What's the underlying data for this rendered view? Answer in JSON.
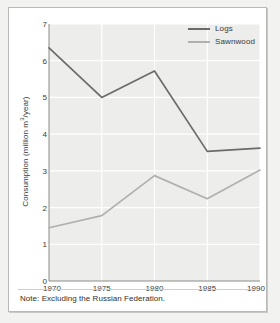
{
  "figure": {
    "footnote": "Note: Excluding the Russian Federation.",
    "frame_color": "#b9b9b5",
    "background": "#ffffff"
  },
  "legend": {
    "position": "top-right",
    "entries": [
      {
        "label": "Logs",
        "color": "#6b6b6b",
        "icon": "line-swatch-icon"
      },
      {
        "label": "Sawnwood",
        "color": "#b0b0b0",
        "icon": "line-swatch-icon"
      }
    ]
  },
  "axes": {
    "y_title_main": "Consumption (million m",
    "y_title_sup": "3",
    "y_title_tail": "/year)",
    "y_ticks": [
      "0",
      "1",
      "2",
      "3",
      "4",
      "5",
      "6",
      "7"
    ],
    "x_ticks": [
      "1970",
      "1975",
      "1980",
      "1985",
      "1990"
    ]
  },
  "style": {
    "plot_background": "#ededeb",
    "gridline_color": "#ffffff",
    "axis_text_color": "#3a3a3a"
  },
  "chart_data": {
    "type": "line",
    "title": "",
    "xlabel": "",
    "ylabel": "Consumption (million m3/year)",
    "x": [
      1970,
      1975,
      1980,
      1985,
      1990
    ],
    "categories": [
      "1970",
      "1975",
      "1980",
      "1985",
      "1990"
    ],
    "series": [
      {
        "name": "Logs",
        "color": "#6b6b6b",
        "values": [
          6.35,
          5.0,
          5.72,
          3.53,
          3.62
        ]
      },
      {
        "name": "Sawnwood",
        "color": "#b0b0b0",
        "values": [
          1.45,
          1.78,
          2.87,
          2.24,
          3.02
        ]
      }
    ],
    "xlim": [
      1970,
      1990
    ],
    "ylim": [
      0,
      7
    ],
    "ytick_values": [
      0,
      1,
      2,
      3,
      4,
      5,
      6,
      7
    ],
    "grid": true,
    "legend_position": "top-right",
    "annotations": [
      "Note: Excluding the Russian Federation."
    ]
  }
}
